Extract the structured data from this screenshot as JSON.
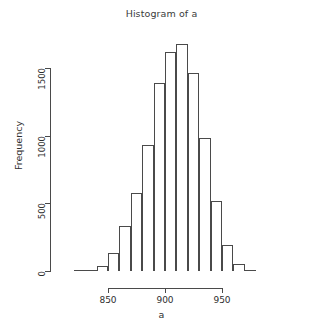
{
  "chart_data": {
    "type": "bar",
    "title": "Histogram of a",
    "xlabel": "a",
    "ylabel": "Frequency",
    "grid": false,
    "legend": null,
    "xlim": [
      818,
      982
    ],
    "ylim": [
      0,
      1700
    ],
    "bin_width": 10,
    "x_ticks": [
      850,
      900,
      950
    ],
    "y_ticks": [
      0,
      500,
      1000,
      1500
    ],
    "bin_starts": [
      820,
      830,
      840,
      850,
      860,
      870,
      880,
      890,
      900,
      910,
      920,
      930,
      940,
      950,
      960,
      970
    ],
    "bin_ends": [
      830,
      840,
      850,
      860,
      870,
      880,
      890,
      900,
      910,
      920,
      930,
      940,
      950,
      960,
      970,
      980
    ],
    "categories": [
      "820-830",
      "830-840",
      "840-850",
      "850-860",
      "860-870",
      "870-880",
      "880-890",
      "890-900",
      "900-910",
      "910-920",
      "920-930",
      "930-940",
      "940-950",
      "950-960",
      "960-970",
      "970-980"
    ],
    "values": [
      3,
      12,
      40,
      130,
      330,
      580,
      930,
      1390,
      1620,
      1680,
      1460,
      985,
      520,
      195,
      50,
      6
    ]
  },
  "chart": {
    "title": "Histogram of a",
    "x_axis": {
      "label": "a",
      "ticks": [
        "850",
        "900",
        "950"
      ]
    },
    "y_axis": {
      "label": "Frequency",
      "ticks": [
        "0",
        "500",
        "1000",
        "1500"
      ]
    }
  }
}
